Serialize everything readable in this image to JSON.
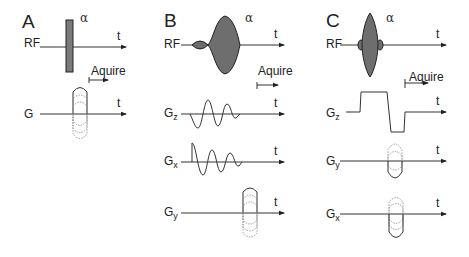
{
  "figure": {
    "panels": [
      {
        "id": "A",
        "label": "A",
        "flip_angle": "α",
        "rows": [
          {
            "name": "RF",
            "axis_label": "t"
          },
          {
            "name": "G",
            "axis_label": "t"
          }
        ],
        "acquire_label": "Aquire"
      },
      {
        "id": "B",
        "label": "B",
        "flip_angle": "α",
        "rows": [
          {
            "name": "RF",
            "axis_label": "t"
          },
          {
            "name": "G",
            "sub": "z",
            "axis_label": "t"
          },
          {
            "name": "G",
            "sub": "x",
            "axis_label": "t"
          },
          {
            "name": "G",
            "sub": "y",
            "axis_label": "t"
          }
        ],
        "acquire_label": "Aquire"
      },
      {
        "id": "C",
        "label": "C",
        "flip_angle": "α",
        "rows": [
          {
            "name": "RF",
            "axis_label": "t"
          },
          {
            "name": "G",
            "sub": "z",
            "axis_label": "t"
          },
          {
            "name": "G",
            "sub": "y",
            "axis_label": "t"
          },
          {
            "name": "G",
            "sub": "x",
            "axis_label": "t"
          }
        ],
        "acquire_label": "Aquire"
      }
    ]
  }
}
